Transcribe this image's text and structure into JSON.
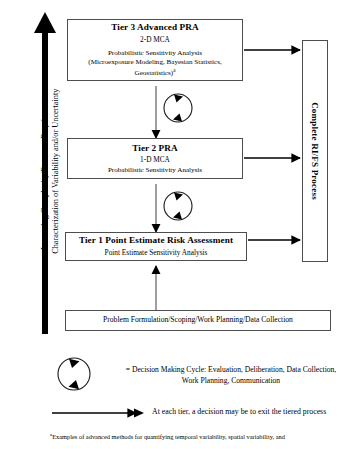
{
  "figure": {
    "axis": {
      "line1": "Increasing Complexity/Resource Requirements",
      "line2": "Characterization of Variability and/or Uncertainty"
    },
    "tiers": [
      {
        "id": "tier3",
        "title": "Tier 3 Advanced PRA",
        "subtitle": "2-D MCA",
        "line1": "Probabilistic Sensitivity Analysis",
        "line2": "(Microexposure Modeling, Bayesian Statistics,",
        "line3": "Geostatistics)",
        "footnote_marker": "a"
      },
      {
        "id": "tier2",
        "title": "Tier 2 PRA",
        "subtitle": "1-D MCA",
        "line1": "Probabilistic Sensitivity Analysis"
      },
      {
        "id": "tier1",
        "title": "Tier 1 Point Estimate Risk Assessment",
        "subtitle": "Point Estimate Sensitivity Analysis"
      }
    ],
    "foundation": {
      "label": "Problem Formulation/Scoping/Work Planning/Data Collection"
    },
    "process": {
      "label": "Complete RI/FS Process"
    },
    "legend": {
      "cycle_line1": "= Decision Making Cycle: Evaluation, Deliberation, Data Collection,",
      "cycle_line2": "Work Planning, Communication",
      "arrow_text": "At each tier, a decision may be to exit the tiered process"
    },
    "footnote": {
      "marker": "a",
      "text": "Examples of advanced methods for quantifying temporal variability, spatial variability, and"
    },
    "colors": {
      "stroke": "#4d4d4d",
      "ink": "#000000",
      "background": "#ffffff"
    }
  }
}
